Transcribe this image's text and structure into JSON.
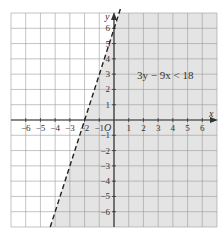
{
  "chart_data": {
    "type": "line",
    "title": "",
    "xlabel": "x",
    "ylabel": "y",
    "origin_label": "O",
    "xlim": [
      -7,
      7
    ],
    "ylim": [
      -7,
      7
    ],
    "grid": true,
    "x_ticks": [
      -6,
      -5,
      -4,
      -3,
      -2,
      -1,
      1,
      2,
      3,
      4,
      5,
      6
    ],
    "y_ticks": [
      -6,
      -5,
      -4,
      -3,
      -2,
      -1,
      1,
      2,
      3,
      4,
      5,
      6
    ],
    "x_tick_labels": [
      "−6",
      "−5",
      "−4",
      "−3",
      "−2",
      "−1",
      "1",
      "2",
      "3",
      "4",
      "5",
      "6"
    ],
    "y_tick_labels": [
      "−6",
      "−5",
      "−4",
      "−3",
      "−2",
      "−1",
      "1",
      "2",
      "3",
      "4",
      "5",
      "6"
    ],
    "series": [
      {
        "name": "boundary 3y − 9x = 18 (y = 3x + 6)",
        "style": "dashed",
        "slope": 3,
        "intercept": 6,
        "points": [
          {
            "x": -2,
            "y": 0
          },
          {
            "x": 0,
            "y": 6
          }
        ]
      }
    ],
    "shaded_region": {
      "inequality": "3y − 9x < 18",
      "side": "right/below boundary line",
      "fill": "#e4e4e4"
    },
    "annotations": [
      {
        "text": "3y − 9x < 18",
        "x": 3.5,
        "y": 3
      }
    ]
  },
  "labels": {
    "inequality": "3y − 9x < 18",
    "x_axis": "x",
    "y_axis": "y",
    "origin": "O"
  },
  "colors": {
    "shade": "#e4e4e4",
    "grid": "#9a9a9a",
    "axis": "#333333",
    "line": "#222222"
  }
}
